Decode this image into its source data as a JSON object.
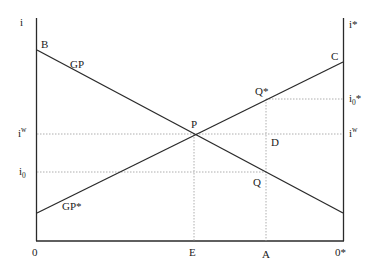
{
  "diagram": {
    "type": "two-country interest rate / gold point diagram",
    "axes": {
      "left_y_label": "i",
      "right_y_label": "i*",
      "origin_left": "0",
      "origin_right": "0*"
    },
    "lines": [
      {
        "name": "GP",
        "from_label": "B",
        "to": "right-axis-low",
        "slope": "downward"
      },
      {
        "name": "GP*",
        "from": "left-axis-low",
        "to_label": "C",
        "slope": "upward"
      }
    ],
    "points": {
      "B": "B",
      "C": "C",
      "P": "P",
      "Q": "Q",
      "Q_star": "Q*",
      "D": "D",
      "E": "E",
      "A": "A"
    },
    "levels": {
      "i_w_left": {
        "base": "i",
        "sup": "w"
      },
      "i_0_left": {
        "base": "i",
        "sub": "0"
      },
      "i_w_right": {
        "base": "i",
        "sup": "w"
      },
      "i_0_star_right": {
        "base": "i",
        "sub": "0",
        "suffix": "*"
      }
    },
    "curve_labels": {
      "gp": "GP",
      "gp_star": "GP*"
    },
    "colors": {
      "line": "#2a2a2a",
      "dotted": "#9a9a9a",
      "text": "#222222"
    }
  }
}
